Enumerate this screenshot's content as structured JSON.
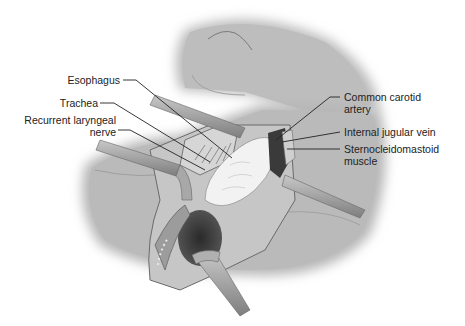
{
  "figure": {
    "colors": {
      "background": "#ffffff",
      "skin": "#b8b8b8",
      "skin_dark": "#8f8f8f",
      "incision_edge": "#6a6a6a",
      "tissue_light": "#e8e8e8",
      "cavity": "#3a3a3a",
      "retractor": "#9a9a9a",
      "label_text": "#222222",
      "leader_line": "#222222"
    }
  },
  "labels": {
    "left": [
      {
        "id": "esophagus",
        "text": "Esophagus"
      },
      {
        "id": "trachea",
        "text": "Trachea"
      },
      {
        "id": "recurrent_laryngeal_nerve",
        "line1": "Recurrent laryngeal",
        "line2": "nerve"
      }
    ],
    "right": [
      {
        "id": "common_carotid_artery",
        "line1": "Common carotid",
        "line2": "artery"
      },
      {
        "id": "internal_jugular_vein",
        "text": "Internal jugular vein"
      },
      {
        "id": "sternocleidomastoid_muscle",
        "line1": "Sternocleidomastoid",
        "line2": "muscle"
      }
    ]
  }
}
